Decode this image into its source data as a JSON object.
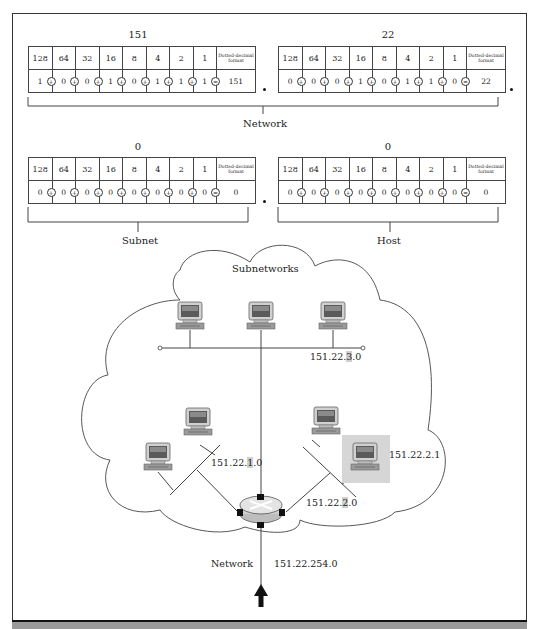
{
  "diagram": {
    "octets": [
      {
        "id": "octet-1",
        "title": "151",
        "place_values": [
          "128",
          "64",
          "32",
          "16",
          "8",
          "4",
          "2",
          "1"
        ],
        "format_header": "Dotted-decimal format",
        "bits": [
          "1",
          "0",
          "0",
          "1",
          "0",
          "1",
          "1",
          "1"
        ],
        "operators": [
          "+",
          "+",
          "+",
          "+",
          "+",
          "+",
          "+",
          "="
        ],
        "decimal": "151"
      },
      {
        "id": "octet-2",
        "title": "22",
        "place_values": [
          "128",
          "64",
          "32",
          "16",
          "8",
          "4",
          "2",
          "1"
        ],
        "format_header": "Dotted-decimal format",
        "bits": [
          "0",
          "0",
          "0",
          "1",
          "0",
          "1",
          "1",
          "0"
        ],
        "operators": [
          "+",
          "+",
          "+",
          "+",
          "+",
          "+",
          "+",
          "="
        ],
        "decimal": "22"
      },
      {
        "id": "octet-3",
        "title": "0",
        "place_values": [
          "128",
          "64",
          "32",
          "16",
          "8",
          "4",
          "2",
          "1"
        ],
        "format_header": "Dotted-decimal format",
        "bits": [
          "0",
          "0",
          "0",
          "0",
          "0",
          "0",
          "0",
          "0"
        ],
        "operators": [
          "+",
          "+",
          "+",
          "+",
          "+",
          "+",
          "+",
          "="
        ],
        "decimal": "0"
      },
      {
        "id": "octet-4",
        "title": "0",
        "place_values": [
          "128",
          "64",
          "32",
          "16",
          "8",
          "4",
          "2",
          "1"
        ],
        "format_header": "Dotted-decimal format",
        "bits": [
          "0",
          "0",
          "0",
          "0",
          "0",
          "0",
          "0",
          "0"
        ],
        "operators": [
          "+",
          "+",
          "+",
          "+",
          "+",
          "+",
          "+",
          "="
        ],
        "decimal": "0"
      }
    ],
    "brackets": {
      "network": "Network",
      "subnet": "Subnet",
      "host": "Host"
    },
    "cloud_label": "Subnetworks",
    "subnets": [
      {
        "prefix": "151.22.",
        "highlight": "3",
        "suffix": ".0"
      },
      {
        "prefix": "151.22.",
        "highlight": "1",
        "suffix": ".0"
      },
      {
        "prefix": "151.22.",
        "highlight": "2",
        "suffix": ".0"
      }
    ],
    "host_address": "151.22.2.1",
    "uplink": {
      "label": "Network",
      "address": "151.22.254.0"
    },
    "icons": [
      "computer-icon",
      "router-icon",
      "up-arrow-icon"
    ],
    "colors": {
      "border": "#333333",
      "highlight": "#cfcfcf",
      "host_box": "#d6d6d6",
      "band": "#9a9a9a"
    }
  }
}
